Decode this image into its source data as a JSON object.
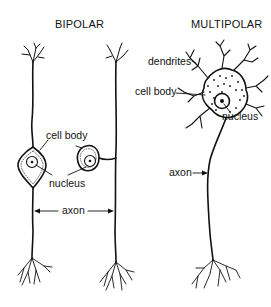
{
  "diagram": {
    "type": "biology-illustration",
    "panels": [
      {
        "title": "BIPOLAR",
        "neurons": 2,
        "labels": {
          "cell_body": "cell body",
          "nucleus": "nucleus",
          "axon": "axon"
        }
      },
      {
        "title": "MULTIPOLAR",
        "neurons": 1,
        "labels": {
          "dendrites": "dendrites",
          "cell_body": "cell body",
          "nucleus": "nucleus",
          "axon": "axon"
        }
      }
    ],
    "colors": {
      "ink": "#111111",
      "background": "#ffffff"
    }
  }
}
